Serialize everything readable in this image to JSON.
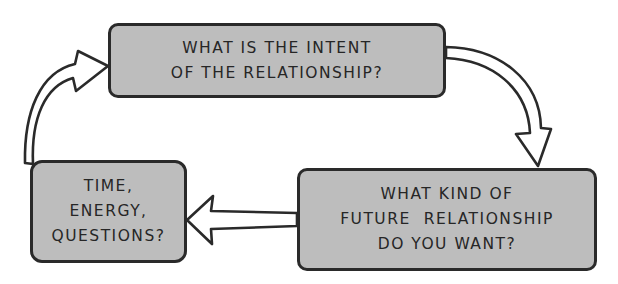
{
  "diagram": {
    "type": "cycle",
    "nodes": [
      {
        "id": "intent",
        "lines": [
          "WHAT IS THE INTENT",
          "OF THE RELATIONSHIP?"
        ]
      },
      {
        "id": "future",
        "lines": [
          "WHAT KIND OF",
          "FUTURE  RELATIONSHIP",
          "DO YOU WANT?"
        ]
      },
      {
        "id": "resources",
        "lines": [
          "TIME,",
          "ENERGY,",
          "QUESTIONS?"
        ]
      }
    ],
    "edges": [
      {
        "from": "intent",
        "to": "future",
        "style": "hollow-curved-arrow"
      },
      {
        "from": "future",
        "to": "resources",
        "style": "hollow-straight-arrow"
      },
      {
        "from": "resources",
        "to": "intent",
        "style": "hollow-curved-arrow"
      }
    ],
    "colors": {
      "box_fill": "#bdbdbd",
      "outline": "#2a2a2a",
      "text": "#262626",
      "background": "#ffffff"
    }
  }
}
